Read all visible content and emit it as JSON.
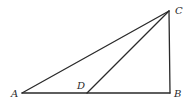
{
  "diagram": {
    "type": "geometry",
    "points": {
      "A": {
        "label": "A",
        "x": 22,
        "y": 93,
        "label_x": 11,
        "label_y": 97
      },
      "B": {
        "label": "B",
        "x": 170,
        "y": 93,
        "label_x": 174,
        "label_y": 97
      },
      "C": {
        "label": "C",
        "x": 169,
        "y": 11,
        "label_x": 175,
        "label_y": 14
      },
      "D": {
        "label": "D",
        "x": 87,
        "y": 93,
        "label_x": 77,
        "label_y": 89
      }
    },
    "segments": [
      {
        "name": "AB",
        "from": "A",
        "to": "B"
      },
      {
        "name": "BC",
        "from": "B",
        "to": "C"
      },
      {
        "name": "AC",
        "from": "A",
        "to": "C"
      },
      {
        "name": "DC",
        "from": "D",
        "to": "C"
      }
    ],
    "stroke_color": "#2a2a2a",
    "background_color": "#ffffff"
  }
}
